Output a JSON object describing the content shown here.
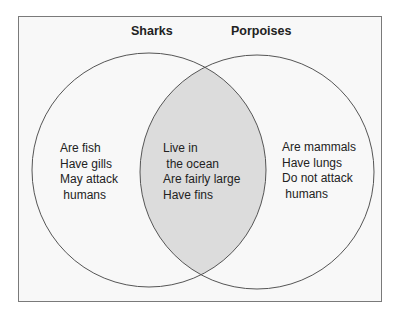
{
  "diagram": {
    "type": "venn",
    "colors": {
      "background": "#f8f8f8",
      "border": "#7a7a7a",
      "circle_stroke": "#555555",
      "overlap_fill": "#dcdcdc",
      "text": "#222222"
    },
    "sets": [
      {
        "label": "Sharks",
        "items": [
          "Are fish",
          "Have gills",
          "May attack",
          " humans"
        ]
      },
      {
        "label": "Porpoises",
        "items": [
          "Are mammals",
          "Have lungs",
          "Do not attack",
          " humans"
        ]
      }
    ],
    "overlap": {
      "items": [
        "Live in",
        " the ocean",
        "Are fairly large",
        "Have fins"
      ]
    }
  }
}
